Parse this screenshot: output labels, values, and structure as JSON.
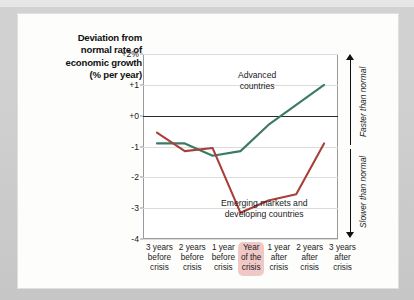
{
  "title": {
    "lines": [
      "Deviation from",
      "normal rate of",
      "economic growth",
      "(% per year)"
    ]
  },
  "right_axis": {
    "faster_label": "Faster than normal",
    "slower_label": "Slower than normal"
  },
  "colors": {
    "advanced": "#3d7a66",
    "emerging": "#a8403a",
    "zero_line": "#2b2b2b",
    "grid": "#dcdcdc",
    "highlight_pill": "#f0c9c6",
    "card": "#fdfdfc",
    "page": "#cfcfcf"
  },
  "xcats": [
    {
      "lines": [
        "3 years",
        "before",
        "crisis"
      ],
      "highlight": false
    },
    {
      "lines": [
        "2 years",
        "before",
        "crisis"
      ],
      "highlight": false
    },
    {
      "lines": [
        "1 year",
        "before",
        "crisis"
      ],
      "highlight": false
    },
    {
      "lines": [
        "Year",
        "of the",
        "crisis"
      ],
      "highlight": true
    },
    {
      "lines": [
        "1 year",
        "after",
        "crisis"
      ],
      "highlight": false
    },
    {
      "lines": [
        "2 years",
        "after",
        "crisis"
      ],
      "highlight": false
    },
    {
      "lines": [
        "3 years",
        "after",
        "crisis"
      ],
      "highlight": false
    }
  ],
  "chart_data": {
    "type": "line",
    "title": "Deviation from normal rate of economic growth (% per year)",
    "xlabel": "",
    "ylabel": "Deviation from normal rate of economic growth (% per year)",
    "ylim": [
      -4,
      2
    ],
    "yticks": [
      2,
      1,
      0,
      -1,
      -2,
      -3,
      -4
    ],
    "ytick_labels": [
      "+2%",
      "+1",
      "+0",
      "-1",
      "-2",
      "-3",
      "-4"
    ],
    "grid": true,
    "zero_line": 0,
    "legend": "inline-annotations",
    "categories": [
      "3 years before crisis",
      "2 years before crisis",
      "1 year before crisis",
      "Year of the crisis",
      "1 year after crisis",
      "2 years after crisis",
      "3 years after crisis"
    ],
    "series": [
      {
        "name": "Advanced countries",
        "color": "#3d7a66",
        "values": [
          -0.9,
          -0.9,
          -1.3,
          -1.15,
          -0.3,
          0.35,
          1.0
        ]
      },
      {
        "name": "Emerging markets and developing countries",
        "color": "#a8403a",
        "values": [
          -0.55,
          -1.15,
          -1.05,
          -3.15,
          -2.75,
          -2.55,
          -0.9
        ]
      }
    ],
    "annotations": [
      {
        "text": "Advanced countries",
        "series": "Advanced countries"
      },
      {
        "text": "Emerging markets and developing countries",
        "series": "Emerging markets and developing countries"
      },
      {
        "text": "Faster than normal",
        "position": "right-upper"
      },
      {
        "text": "Slower than normal",
        "position": "right-lower"
      }
    ]
  }
}
